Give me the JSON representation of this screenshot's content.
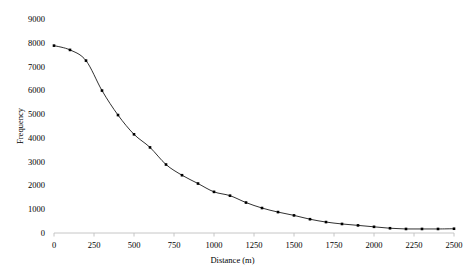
{
  "chart_data": {
    "type": "line",
    "title": "",
    "xlabel": "Distance (m)",
    "ylabel": "Frequency",
    "xlim": [
      0,
      2500
    ],
    "ylim": [
      0,
      9000
    ],
    "grid": false,
    "legend": "none",
    "marker": "filled-square",
    "line_color": "#1a1a1a",
    "marker_color": "#000000",
    "axis_color": "#bfbfbf",
    "text_color": "#000000",
    "xticks": [
      0,
      250,
      500,
      750,
      1000,
      1250,
      1500,
      1750,
      2000,
      2250,
      2500
    ],
    "xtick_labels": [
      "0",
      "250",
      "500",
      "750",
      "1000",
      "1250",
      "1500",
      "1750",
      "2000",
      "2250",
      "2500"
    ],
    "yticks": [
      0,
      1000,
      2000,
      3000,
      4000,
      5000,
      6000,
      7000,
      8000,
      9000
    ],
    "ytick_labels": [
      "0",
      "1000",
      "2000",
      "3000",
      "4000",
      "5000",
      "6000",
      "7000",
      "8000",
      "9000"
    ],
    "x": [
      0,
      100,
      200,
      300,
      400,
      500,
      600,
      700,
      800,
      900,
      1000,
      1100,
      1200,
      1300,
      1400,
      1500,
      1600,
      1700,
      1800,
      1900,
      2000,
      2100,
      2200,
      2300,
      2400,
      2500
    ],
    "values": [
      7880,
      7700,
      7250,
      5990,
      4960,
      4150,
      3600,
      2880,
      2430,
      2080,
      1730,
      1570,
      1280,
      1050,
      880,
      740,
      580,
      460,
      380,
      320,
      260,
      200,
      170,
      170,
      170,
      180
    ],
    "series": [
      {
        "name": "Frequency",
        "values": [
          7880,
          7700,
          7250,
          5990,
          4960,
          4150,
          3600,
          2880,
          2430,
          2080,
          1730,
          1570,
          1280,
          1050,
          880,
          740,
          580,
          460,
          380,
          320,
          260,
          200,
          170,
          170,
          170,
          180
        ]
      }
    ]
  }
}
